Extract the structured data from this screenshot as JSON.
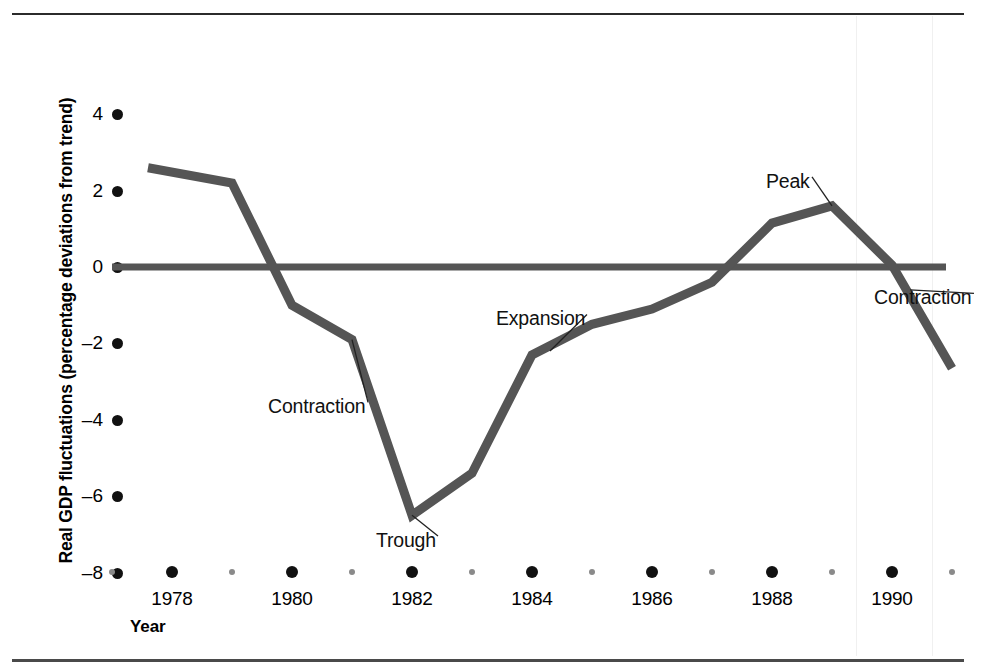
{
  "figure": {
    "y_axis_title": "Real GDP fluctuations (percentage deviations from trend)",
    "x_axis_title": "Year"
  },
  "chart_data": {
    "type": "line",
    "title": "",
    "xlabel": "Year",
    "ylabel": "Real GDP fluctuations (percentage deviations from trend)",
    "xlim": [
      1977,
      1991
    ],
    "ylim": [
      -8,
      4
    ],
    "yticks": [
      4,
      2,
      0,
      -2,
      -4,
      -6,
      -8
    ],
    "ytick_labels": [
      "4",
      "2",
      "0",
      "-2",
      "-4",
      "-6",
      "-8"
    ],
    "xticks": [
      1978,
      1980,
      1982,
      1984,
      1986,
      1988,
      1990
    ],
    "xtick_labels": [
      "1978",
      "1980",
      "1982",
      "1984",
      "1986",
      "1988",
      "1990"
    ],
    "xticks_minor": [
      1977,
      1979,
      1981,
      1983,
      1985,
      1987,
      1989,
      1991
    ],
    "grid": false,
    "legend": null,
    "reference_line": {
      "y": 0,
      "label": "trend",
      "color": "#555555"
    },
    "series": [
      {
        "name": "Real GDP fluctuations",
        "color": "#555555",
        "x": [
          1977.6,
          1979.0,
          1980.0,
          1981.0,
          1982.0,
          1983.0,
          1984.0,
          1985.0,
          1986.0,
          1987.0,
          1988.0,
          1989.0,
          1990.0,
          1991.0
        ],
        "values": [
          2.6,
          2.2,
          -1.0,
          -1.9,
          -6.5,
          -5.4,
          -2.3,
          -1.5,
          -1.1,
          -0.4,
          1.15,
          1.6,
          0.05,
          -2.65
        ]
      }
    ],
    "annotations": [
      {
        "text": "Contraction",
        "x": 1979.6,
        "y": -3.7,
        "points_to": {
          "x": 1981.0,
          "y": -1.9
        }
      },
      {
        "text": "Trough",
        "x": 1981.4,
        "y": -7.2,
        "points_to": {
          "x": 1982.0,
          "y": -6.5
        }
      },
      {
        "text": "Expansion",
        "x": 1983.4,
        "y": -1.4,
        "points_to": {
          "x": 1984.3,
          "y": -2.2
        }
      },
      {
        "text": "Peak",
        "x": 1987.9,
        "y": 2.2,
        "points_to": {
          "x": 1989.0,
          "y": 1.6
        }
      },
      {
        "text": "Contraction",
        "x": 1989.7,
        "y": -0.85,
        "points_to": {
          "x": 1990.3,
          "y": -0.6
        }
      }
    ]
  },
  "colors": {
    "line": "#555555",
    "axis_dot": "#111111",
    "minor_dot": "#8a8a8a",
    "rule": "#2b2b2b",
    "text": "#000000"
  }
}
